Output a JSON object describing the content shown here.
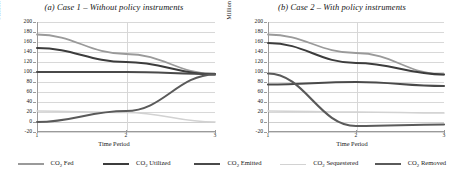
{
  "figure": {
    "x_axis_title": "Time Period",
    "y_axis_title_pre": "Million tons of CO",
    "y_axis_title_sub": "2"
  },
  "legend": {
    "items": [
      {
        "label_pre": "CO",
        "label_sub": "2",
        "label_post": " Fed",
        "color": "#9a9a9a"
      },
      {
        "label_pre": "CO",
        "label_sub": "2",
        "label_post": " Utilized",
        "color": "#3c3c3c"
      },
      {
        "label_pre": "CO",
        "label_sub": "2",
        "label_post": " Emitted",
        "color": "#4a4a4a"
      },
      {
        "label_pre": "CO",
        "label_sub": "2",
        "label_post": " Sequestered",
        "color": "#d2d2d2"
      },
      {
        "label_pre": "CO",
        "label_sub": "2",
        "label_post": " Removed",
        "color": "#5a5a5a"
      }
    ]
  },
  "chart_data": [
    {
      "type": "line",
      "title": "(a) Case 1 – Without policy instruments",
      "xlabel": "Time Period",
      "ylabel": "Million tons of CO2",
      "x": [
        1,
        2,
        3
      ],
      "xticks": [
        "1",
        "2",
        "3"
      ],
      "yticks": [
        200,
        180,
        160,
        140,
        120,
        100,
        80,
        60,
        40,
        20,
        0,
        -20
      ],
      "ylim": [
        -20,
        200
      ],
      "xlim": [
        1,
        3
      ],
      "grid": true,
      "legend_position": "below-figure",
      "series": [
        {
          "name": "CO2 Fed",
          "values": [
            175,
            136,
            96
          ],
          "color": "#9a9a9a",
          "width": 1.8
        },
        {
          "name": "CO2 Utilized",
          "values": [
            148,
            120,
            95
          ],
          "color": "#3c3c3c",
          "width": 2.0
        },
        {
          "name": "CO2 Emitted",
          "values": [
            100,
            100,
            96
          ],
          "color": "#4a4a4a",
          "width": 2.2
        },
        {
          "name": "CO2 Sequestered",
          "values": [
            22,
            19,
            0
          ],
          "color": "#d2d2d2",
          "width": 1.6
        },
        {
          "name": "CO2 Removed",
          "values": [
            0,
            22,
            95
          ],
          "color": "#5a5a5a",
          "width": 2.0
        }
      ]
    },
    {
      "type": "line",
      "title": "(b) Case 2 – With policy instruments",
      "xlabel": "Time Period",
      "ylabel": "Million tons of CO2",
      "x": [
        1,
        2,
        3
      ],
      "xticks": [
        "1",
        "2",
        "3"
      ],
      "yticks": [
        200,
        180,
        160,
        140,
        120,
        100,
        80,
        60,
        40,
        20,
        0,
        -20
      ],
      "ylim": [
        -20,
        200
      ],
      "xlim": [
        1,
        3
      ],
      "grid": true,
      "legend_position": "below-figure",
      "series": [
        {
          "name": "CO2 Fed",
          "values": [
            175,
            138,
            95
          ],
          "color": "#9a9a9a",
          "width": 1.8
        },
        {
          "name": "CO2 Utilized",
          "values": [
            158,
            118,
            95
          ],
          "color": "#3c3c3c",
          "width": 2.0
        },
        {
          "name": "CO2 Emitted",
          "values": [
            75,
            80,
            72
          ],
          "color": "#4a4a4a",
          "width": 2.2
        },
        {
          "name": "CO2 Sequestered",
          "values": [
            22,
            20,
            18
          ],
          "color": "#d2d2d2",
          "width": 1.6
        },
        {
          "name": "CO2 Removed",
          "values": [
            97,
            -8,
            -5
          ],
          "color": "#5a5a5a",
          "width": 2.2
        }
      ]
    }
  ]
}
